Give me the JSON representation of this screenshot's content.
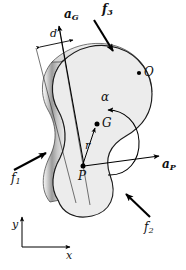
{
  "figure": {
    "background_color": "#ffffff",
    "body_fill_color": "#ececec",
    "body_edge_color": "#b8b8b8",
    "outline_color": "#1a1a1a",
    "arrow_color": "#000000"
  },
  "labels": {
    "a_g": {
      "base": "a",
      "sub": "G"
    },
    "a_p": {
      "base": "a",
      "sub": "P"
    },
    "f1": {
      "base": "f",
      "sub": "1"
    },
    "f2": {
      "base": "f",
      "sub": "2"
    },
    "f3": {
      "base": "f",
      "sub": "3"
    },
    "d": "d",
    "r": "r",
    "alpha": "α",
    "point_g": "G",
    "point_p": "P",
    "point_o": "O",
    "axis_x": "x",
    "axis_y": "y"
  },
  "points": [
    {
      "name": "G",
      "label": "G",
      "x": 97,
      "y": 124,
      "desc": "center of mass"
    },
    {
      "name": "P",
      "label": "P",
      "x": 82,
      "y": 166,
      "desc": "reference point P"
    },
    {
      "name": "O",
      "label": "O",
      "x": 141,
      "y": 73,
      "desc": "fixed point O"
    }
  ],
  "vectors": [
    {
      "name": "a_G",
      "from": [
        82,
        166
      ],
      "to": [
        59,
        25
      ],
      "label": "a_G",
      "desc": "acceleration of mass center"
    },
    {
      "name": "a_P",
      "from": [
        84,
        166
      ],
      "to": [
        162,
        155
      ],
      "label": "a_P",
      "desc": "acceleration of point P"
    },
    {
      "name": "r",
      "from": [
        82,
        166
      ],
      "to": [
        95,
        127
      ],
      "label": "r",
      "desc": "position vector from P to G"
    },
    {
      "name": "f_1",
      "from": [
        17,
        168
      ],
      "to": [
        48,
        152
      ],
      "label": "f1",
      "desc": "external force f1 applied on left edge"
    },
    {
      "name": "f_2",
      "from": [
        148,
        215
      ],
      "to": [
        125,
        193
      ],
      "label": "f2",
      "desc": "external force f2 applied lower right"
    },
    {
      "name": "f_3",
      "from": [
        95,
        21
      ],
      "to": [
        112,
        50
      ],
      "label": "f3",
      "desc": "external force f3 applied upper edge"
    },
    {
      "name": "alpha",
      "type": "curved",
      "label": "alpha",
      "desc": "angular acceleration, counterclockwise"
    },
    {
      "name": "d",
      "type": "dimension",
      "label": "d",
      "desc": "perpendicular distance between parallel lines through P and G"
    }
  ],
  "axes": {
    "origin": [
      22,
      247
    ],
    "x_end": [
      72,
      247
    ],
    "y_end": [
      22,
      215
    ],
    "x_label": "x",
    "y_label": "y"
  }
}
